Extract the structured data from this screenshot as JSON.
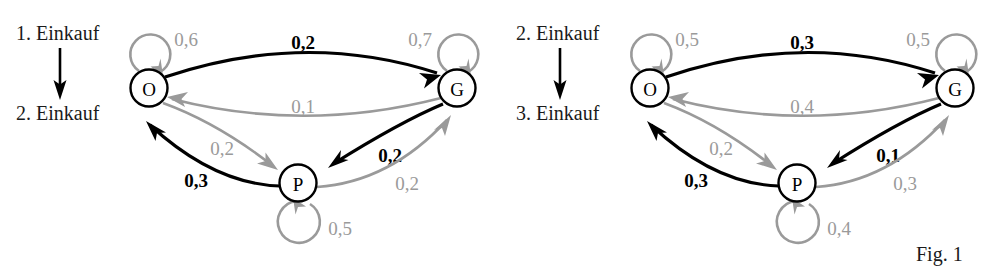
{
  "figure": {
    "caption": "Fig. 1",
    "node_labels": {
      "o": "O",
      "g": "G",
      "p": "P"
    }
  },
  "panels": [
    {
      "id": "panel-left",
      "step_from": "1. Einkauf",
      "step_to": "2. Einkauf",
      "edges": {
        "o_self": "0,6",
        "g_self": "0,7",
        "p_self": "0,5",
        "o_to_g": "0,2",
        "g_to_o": "0,1",
        "o_to_p": "0,2",
        "p_to_o": "0,3",
        "g_to_p": "0,2",
        "p_to_g": "0,2"
      }
    },
    {
      "id": "panel-right",
      "step_from": "2. Einkauf",
      "step_to": "3. Einkauf",
      "edges": {
        "o_self": "0,5",
        "g_self": "0,5",
        "p_self": "0,4",
        "o_to_g": "0,3",
        "g_to_o": "0,4",
        "o_to_p": "0,2",
        "p_to_o": "0,3",
        "g_to_p": "0,1",
        "p_to_g": "0,3"
      }
    }
  ],
  "colors": {
    "dark_edge": "#000000",
    "light_edge": "#9a9a9a",
    "node_stroke": "#000000",
    "text": "#1a1a1a"
  }
}
